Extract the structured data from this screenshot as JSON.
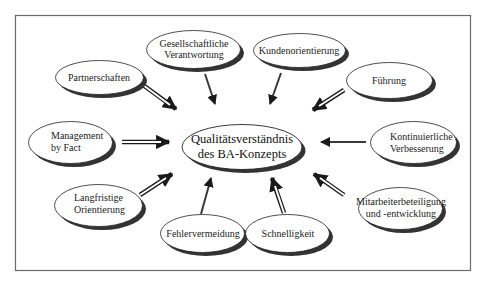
{
  "diagram": {
    "title": "Qualitätsverständnis des BA-Konzepts",
    "colors": {
      "frame": "#6a6a6a",
      "ellipse_fill": "#ffffff",
      "ellipse_stroke": "#2a2a2a",
      "shadow": "#3a3a3a",
      "arrow": "#1a1a1a",
      "text": "#222222"
    },
    "center": {
      "line1": "Qualitätsverständnis",
      "line2": "des BA-Konzepts"
    },
    "nodes": [
      {
        "id": "gesellschaftliche-verantwortung",
        "line1": "Gesellschaftliche",
        "line2": "Verantwortung",
        "arrow_style": "solid"
      },
      {
        "id": "kundenorientierung",
        "line1": "Kundenorientierung",
        "line2": "",
        "arrow_style": "solid"
      },
      {
        "id": "partnerschaften",
        "line1": "Partnerschaften",
        "line2": "",
        "arrow_style": "hollow"
      },
      {
        "id": "fuehrung",
        "line1": "Führung",
        "line2": "",
        "arrow_style": "hollow"
      },
      {
        "id": "management-by-fact",
        "line1": "Management",
        "line2": "by Fact",
        "arrow_style": "hollow"
      },
      {
        "id": "kontinuierliche-verbesserung",
        "line1": "Kontinuierliche",
        "line2": "Verbesserung",
        "arrow_style": "solid"
      },
      {
        "id": "langfristige-orientierung",
        "line1": "Langfristige",
        "line2": "Orientierung",
        "arrow_style": "hollow"
      },
      {
        "id": "mitarbeiterbeteiligung",
        "line1": "Mitarbeiterbeteiligung",
        "line2": "und -entwicklung",
        "arrow_style": "hollow"
      },
      {
        "id": "fehlervermeidung",
        "line1": "Fehlervermeidung",
        "line2": "",
        "arrow_style": "solid"
      },
      {
        "id": "schnelligkeit",
        "line1": "Schnelligkeit",
        "line2": "",
        "arrow_style": "hollow"
      }
    ]
  }
}
